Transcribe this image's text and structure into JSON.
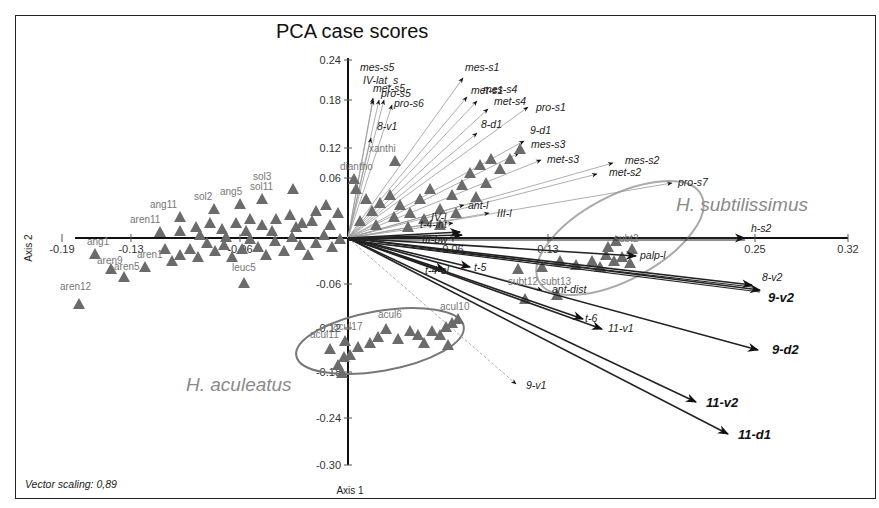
{
  "chart_data": {
    "type": "scatter",
    "subtype": "PCA biplot",
    "title": "PCA case scores",
    "xlabel": "Axis 1",
    "ylabel": "Axis 2",
    "x_ticks": [
      "-0.19",
      "-0.13",
      "-0.06",
      "0.06",
      "0.13",
      "0.25",
      "0.32"
    ],
    "y_ticks": [
      "0.24",
      "0.18",
      "0.12",
      "0.06",
      "-0.06",
      "-0.12",
      "-0.18",
      "-0.24",
      "-0.30"
    ],
    "xlim": [
      -0.19,
      0.32
    ],
    "ylim": [
      -0.3,
      0.24
    ],
    "grid": false,
    "note": "Vector scaling: 0,89",
    "groups": [
      {
        "name": "H. subtilissimus",
        "label_pos": [
          0.25,
          0.05
        ]
      },
      {
        "name": "H. aculeatus",
        "label_pos": [
          -0.12,
          -0.2
        ]
      }
    ],
    "cases": [
      {
        "label": "aren12",
        "x": -0.17,
        "y": -0.09
      },
      {
        "label": "ang1",
        "x": -0.155,
        "y": -0.02
      },
      {
        "label": "aren9",
        "x": -0.145,
        "y": -0.03
      },
      {
        "label": "aren5",
        "x": -0.135,
        "y": -0.04
      },
      {
        "label": "aren1",
        "x": -0.12,
        "y": -0.03
      },
      {
        "label": "leuc5",
        "x": -0.065,
        "y": -0.05
      },
      {
        "label": "aren11",
        "x": -0.12,
        "y": 0.01
      },
      {
        "label": "ang11",
        "x": -0.11,
        "y": 0.02
      },
      {
        "label": "sol2",
        "x": -0.09,
        "y": 0.03
      },
      {
        "label": "ang5",
        "x": -0.07,
        "y": 0.03
      },
      {
        "label": "sol11",
        "x": -0.05,
        "y": 0.04
      },
      {
        "label": "sol3",
        "x": -0.03,
        "y": 0.06
      },
      {
        "label": "diantho",
        "x": 0.01,
        "y": 0.08
      },
      {
        "label": "xanthi",
        "x": 0.03,
        "y": 0.09
      },
      {
        "label": "subt2",
        "x": 0.2,
        "y": 0.0
      },
      {
        "label": "subt13",
        "x": 0.115,
        "y": -0.045
      },
      {
        "label": "subt12",
        "x": 0.09,
        "y": -0.05
      },
      {
        "label": "acul17",
        "x": 0.005,
        "y": -0.11
      },
      {
        "label": "acul6",
        "x": 0.03,
        "y": -0.105
      },
      {
        "label": "acul10",
        "x": 0.07,
        "y": -0.1
      },
      {
        "label": "acul11",
        "x": -0.01,
        "y": -0.13
      }
    ],
    "vectors": [
      {
        "label": "mes-s5",
        "x": 0.01,
        "y": 0.19
      },
      {
        "label": "IV-lat_s",
        "x": 0.015,
        "y": 0.185
      },
      {
        "label": "met-s5",
        "x": 0.02,
        "y": 0.185
      },
      {
        "label": "pro-s5",
        "x": 0.025,
        "y": 0.185
      },
      {
        "label": "pro-s6",
        "x": 0.03,
        "y": 0.175
      },
      {
        "label": "8-v1",
        "x": 0.015,
        "y": 0.15
      },
      {
        "label": "mes-s1",
        "x": 0.085,
        "y": 0.2
      },
      {
        "label": "met-s1",
        "x": 0.09,
        "y": 0.18
      },
      {
        "label": "mes-s4",
        "x": 0.1,
        "y": 0.175
      },
      {
        "label": "met-s4",
        "x": 0.115,
        "y": 0.165
      },
      {
        "label": "pro-s1",
        "x": 0.15,
        "y": 0.155
      },
      {
        "label": "8-d1",
        "x": 0.1,
        "y": 0.13
      },
      {
        "label": "9-d1",
        "x": 0.155,
        "y": 0.11
      },
      {
        "label": "mes-s3",
        "x": 0.155,
        "y": 0.09
      },
      {
        "label": "met-s3",
        "x": 0.165,
        "y": 0.085
      },
      {
        "label": "mes-s2",
        "x": 0.21,
        "y": 0.075
      },
      {
        "label": "met-s2",
        "x": 0.2,
        "y": 0.06
      },
      {
        "label": "pro-s7",
        "x": 0.285,
        "y": 0.05
      },
      {
        "label": "ant-l",
        "x": 0.1,
        "y": 0.03
      },
      {
        "label": "III-l",
        "x": 0.12,
        "y": 0.01
      },
      {
        "label": "IV-l",
        "x": 0.085,
        "y": 0.0
      },
      {
        "label": "t-4-int",
        "x": 0.065,
        "y": -0.005
      },
      {
        "label": "III-bw",
        "x": 0.07,
        "y": -0.005
      },
      {
        "label": "h-s2",
        "x": 0.24,
        "y": -0.01
      },
      {
        "label": "palp-l",
        "x": 0.19,
        "y": -0.03
      },
      {
        "label": "t-5",
        "x": 0.07,
        "y": -0.03
      },
      {
        "label": "t-4-el",
        "x": 0.065,
        "y": -0.04
      },
      {
        "label": "8-v2",
        "x": 0.27,
        "y": -0.065
      },
      {
        "label": "9-v2",
        "x": 0.28,
        "y": -0.07
      },
      {
        "label": "ant-dist",
        "x": 0.14,
        "y": -0.06
      },
      {
        "label": "t-6",
        "x": 0.14,
        "y": -0.095
      },
      {
        "label": "11-v1",
        "x": 0.15,
        "y": -0.1
      },
      {
        "label": "9-d2",
        "x": 0.265,
        "y": -0.15
      },
      {
        "label": "9-v1",
        "x": 0.115,
        "y": -0.185
      },
      {
        "label": "11-v2",
        "x": 0.225,
        "y": -0.22
      },
      {
        "label": "11-d1",
        "x": 0.24,
        "y": -0.25
      }
    ]
  }
}
